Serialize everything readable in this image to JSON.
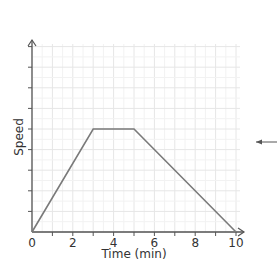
{
  "chart_data": {
    "type": "line",
    "title": "",
    "xlabel": "Time (min)",
    "ylabel": "Speed",
    "x_ticks": [
      "0",
      "2",
      "4",
      "6",
      "8",
      "10"
    ],
    "xlim": [
      0,
      10
    ],
    "ylim": [
      0,
      9
    ],
    "y_tick_count": 9,
    "grid": true,
    "legend": "none",
    "series": [
      {
        "name": "speed",
        "x": [
          0,
          3,
          5,
          10
        ],
        "y": [
          0,
          5,
          5,
          0
        ]
      }
    ],
    "annotations": [
      {
        "type": "arrow",
        "direction": "left",
        "position": "right-of-chart",
        "text": ""
      }
    ],
    "colors": {
      "line": "#7a7a7a",
      "axis": "#555555",
      "grid_major": "#e6e6e6",
      "grid_minor": "#f2f2f2"
    }
  }
}
